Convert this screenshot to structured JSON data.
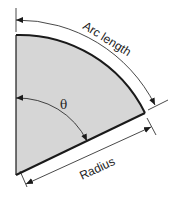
{
  "diagram": {
    "labels": {
      "arc_length": "Arc length",
      "theta": "θ",
      "radius": "Radius"
    },
    "colors": {
      "sector_fill": "#d6d6d6",
      "stroke": "#1a1a1a",
      "background": "#ffffff"
    }
  }
}
